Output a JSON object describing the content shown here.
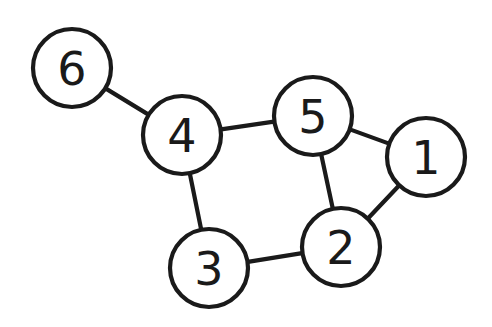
{
  "figure": {
    "kind": "undirected-graph-diagram",
    "background_color": "#ffffff",
    "stroke_color": "#1a1a1a",
    "node_fill_color": "#ffffff",
    "width": 492,
    "height": 327
  },
  "graph_data": {
    "type": "graph",
    "directed": false,
    "node_count": 6,
    "edge_count": 7,
    "node_labels": [
      "1",
      "2",
      "3",
      "4",
      "5",
      "6"
    ],
    "nodes": [
      {
        "id": "1",
        "label": "1",
        "cx": 426,
        "cy": 157,
        "r": 39,
        "degree": 2
      },
      {
        "id": "2",
        "label": "2",
        "cx": 341,
        "cy": 247,
        "r": 39,
        "degree": 3
      },
      {
        "id": "3",
        "label": "3",
        "cx": 209,
        "cy": 268,
        "r": 39,
        "degree": 2
      },
      {
        "id": "4",
        "label": "4",
        "cx": 182,
        "cy": 135,
        "r": 39,
        "degree": 3
      },
      {
        "id": "5",
        "label": "5",
        "cx": 313,
        "cy": 116,
        "r": 39,
        "degree": 3
      },
      {
        "id": "6",
        "label": "6",
        "cx": 72,
        "cy": 68,
        "r": 39,
        "degree": 1
      }
    ],
    "edges": [
      {
        "source": "6",
        "target": "4"
      },
      {
        "source": "4",
        "target": "5"
      },
      {
        "source": "4",
        "target": "3"
      },
      {
        "source": "5",
        "target": "1"
      },
      {
        "source": "5",
        "target": "2"
      },
      {
        "source": "1",
        "target": "2"
      },
      {
        "source": "3",
        "target": "2"
      }
    ],
    "adjacency": {
      "1": [
        "5",
        "2"
      ],
      "2": [
        "5",
        "1",
        "3"
      ],
      "3": [
        "4",
        "2"
      ],
      "4": [
        "6",
        "5",
        "3"
      ],
      "5": [
        "4",
        "1",
        "2"
      ],
      "6": [
        "4"
      ]
    }
  }
}
